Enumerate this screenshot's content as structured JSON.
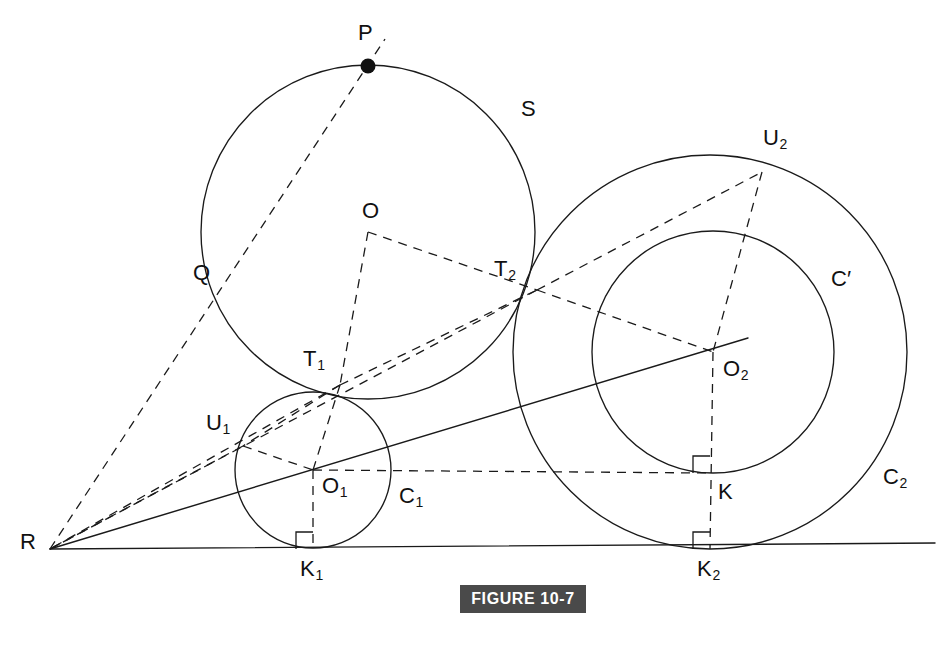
{
  "figure": {
    "caption": "FIGURE 10-7",
    "caption_bg": "#4a4a4a",
    "caption_fg": "#ffffff",
    "stroke_color": "#1a1a1a",
    "background": "#ffffff",
    "width": 948,
    "height": 652
  },
  "labels": {
    "P": "P",
    "S": "S",
    "O": "O",
    "Q": "Q",
    "T1_main": "T",
    "T1_sub": "1",
    "T2_main": "T",
    "T2_sub": "2",
    "U1_main": "U",
    "U1_sub": "1",
    "U2_main": "U",
    "U2_sub": "2",
    "O1_main": "O",
    "O1_sub": "1",
    "O2_main": "O",
    "O2_sub": "2",
    "C1_main": "C",
    "C1_sub": "1",
    "C2_main": "C",
    "C2_sub": "2",
    "Cprime": "C′",
    "K": "K",
    "K1_main": "K",
    "K1_sub": "1",
    "K2_main": "K",
    "K2_sub": "2",
    "R": "R"
  },
  "geometry": {
    "points": {
      "R": [
        50,
        549
      ],
      "P": [
        368,
        66
      ],
      "Q": [
        225,
        283
      ],
      "O": [
        368,
        232
      ],
      "T1": [
        340,
        385
      ],
      "T2": [
        537,
        290
      ],
      "O1": [
        313,
        470
      ],
      "K1": [
        313,
        549
      ],
      "U1": [
        243,
        446
      ],
      "O2": [
        713,
        352
      ],
      "K": [
        710,
        473
      ],
      "K2": [
        710,
        549
      ],
      "U2": [
        762,
        172
      ]
    },
    "circles": [
      {
        "name": "S",
        "cx": 368,
        "cy": 232,
        "r": 167
      },
      {
        "name": "C1",
        "cx": 313,
        "cy": 470,
        "r": 78
      },
      {
        "name": "Cprime",
        "cx": 713,
        "cy": 352,
        "r": 121
      },
      {
        "name": "C2",
        "cx": 710,
        "cy": 352,
        "r": 197
      }
    ],
    "baseline": {
      "x1": 50,
      "y1": 549,
      "x2": 935,
      "y2": 543
    },
    "secant_RO2": {
      "x1": 50,
      "y1": 549,
      "x2": 748,
      "y2": 338
    },
    "dashed_segments": [
      [
        "R",
        "P"
      ],
      [
        "O",
        "T1"
      ],
      [
        "O",
        "T2"
      ],
      [
        "T1",
        "T2"
      ],
      [
        "T1",
        "U1"
      ],
      [
        "T1",
        "O1"
      ],
      [
        "T2",
        "U2"
      ],
      [
        "T2",
        "O2"
      ],
      [
        "T2",
        "R"
      ],
      [
        "U1",
        "R"
      ],
      [
        "U1",
        "O1"
      ],
      [
        "U2",
        "O2"
      ],
      [
        "O1",
        "K1"
      ],
      [
        "O1",
        "K"
      ],
      [
        "O2",
        "K"
      ],
      [
        "K",
        "K2"
      ]
    ],
    "right_angle_marks": [
      {
        "at": "K1",
        "size": 17
      },
      {
        "at": "K",
        "size": 17
      },
      {
        "at": "K2",
        "size": 17
      }
    ],
    "marked_point": "P"
  }
}
